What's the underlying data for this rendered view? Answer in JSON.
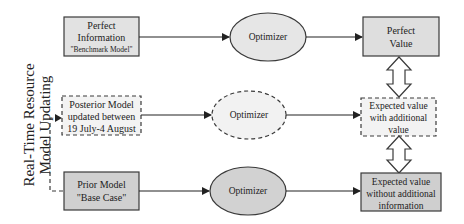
{
  "side_label": {
    "line1": "Real-Time Resource",
    "line2": "Model Updating"
  },
  "rows": [
    {
      "input": {
        "lines": [
          "Perfect",
          "Information",
          "\"Benchmark Model\""
        ],
        "fill": "#e2e2e2",
        "style": "solid"
      },
      "process": {
        "label": "Optimizer",
        "fill": "#e6e6e6",
        "style": "solid"
      },
      "output": {
        "lines": [
          "Perfect",
          "Value"
        ],
        "fill": "#dedede",
        "style": "solid"
      }
    },
    {
      "input": {
        "lines": [
          "Posterior Model",
          "updated between",
          "19 July-4 August"
        ],
        "fill": "#f3f3f3",
        "style": "dashed"
      },
      "process": {
        "label": "Optimizer",
        "fill": "#f2f2f2",
        "style": "dashed"
      },
      "output": {
        "lines": [
          "Expected value",
          "with additional",
          "value"
        ],
        "fill": "#f3f3f3",
        "style": "dashed"
      }
    },
    {
      "input": {
        "lines": [
          "Prior Model",
          "\"Base Case\""
        ],
        "fill": "#d0d0d0",
        "style": "solid"
      },
      "process": {
        "label": "Optimizer",
        "fill": "#d2d2d2",
        "style": "solid"
      },
      "output": {
        "lines": [
          "Expected value",
          "without additional",
          "information"
        ],
        "fill": "#cfcfcf",
        "style": "solid"
      }
    }
  ],
  "colors": {
    "stroke": "#3a3a3a",
    "text": "#222222",
    "background": "#ffffff"
  }
}
